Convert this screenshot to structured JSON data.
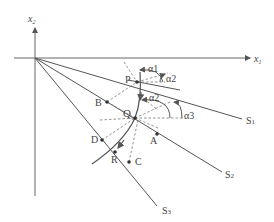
{
  "axes": {
    "x1_label": "x",
    "x1_sub": "1",
    "x2_label": "x",
    "x2_sub": "2"
  },
  "lines": [
    {
      "name": "S",
      "sub": "1"
    },
    {
      "name": "S",
      "sub": "2"
    },
    {
      "name": "S",
      "sub": "3"
    }
  ],
  "points": {
    "P": "P",
    "Q": "Q",
    "R": "R",
    "A": "A",
    "B": "B",
    "C": "C",
    "D": "D"
  },
  "angles": {
    "alpha1": "α1",
    "alpha2_top": "α2",
    "alpha2_mid": "α2",
    "alpha3": "α3"
  },
  "colors": {
    "line": "#555555",
    "background": "#ffffff"
  }
}
